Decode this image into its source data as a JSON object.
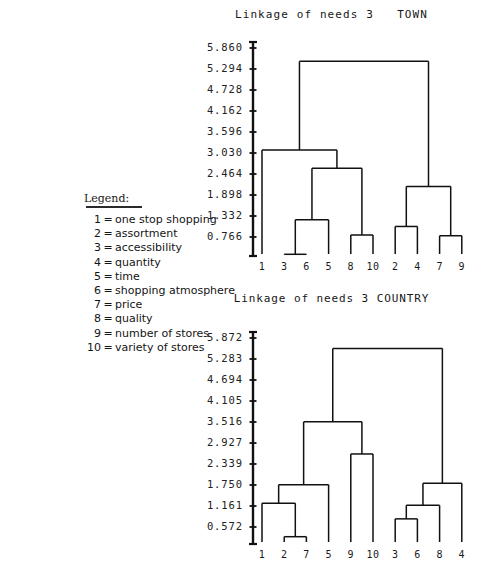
{
  "page": {
    "background": "#ffffff",
    "ink": "#1a1a1a"
  },
  "legend": {
    "title": "Legend:",
    "items": [
      {
        "num": "1",
        "eq": "=",
        "label": "one stop shopping"
      },
      {
        "num": "2",
        "eq": "=",
        "label": "assortment"
      },
      {
        "num": "3",
        "eq": "=",
        "label": "accessibility"
      },
      {
        "num": "4",
        "eq": "=",
        "label": "quantity"
      },
      {
        "num": "5",
        "eq": "=",
        "label": "time"
      },
      {
        "num": "6",
        "eq": "=",
        "label": "shopping atmosphere"
      },
      {
        "num": "7",
        "eq": "=",
        "label": "price"
      },
      {
        "num": "8",
        "eq": "=",
        "label": "quality"
      },
      {
        "num": "9",
        "eq": "=",
        "label": "number of stores"
      },
      {
        "num": "10",
        "eq": "=",
        "label": "variety of stores"
      }
    ]
  },
  "chart_data": [
    {
      "id": "town",
      "type": "dendrogram",
      "title": "Linkage of needs 3   TOWN",
      "xlabel": "",
      "ylabel": "",
      "grid": false,
      "legend_position": "none",
      "ylim": [
        0.2,
        5.86
      ],
      "axis_ticks": [
        "5.860",
        "5.294",
        "4.728",
        "4.162",
        "3.596",
        "3.030",
        "2.464",
        "1.898",
        "1.332",
        "0.766"
      ],
      "tick_values": [
        5.86,
        5.294,
        4.728,
        4.162,
        3.596,
        3.03,
        2.464,
        1.898,
        1.332,
        0.766
      ],
      "leaf_order": [
        "1",
        "3",
        "6",
        "5",
        "8",
        "10",
        "2",
        "4",
        "7",
        "9"
      ],
      "merges": [
        {
          "name": "3+6",
          "members": [
            "3",
            "6"
          ],
          "height": 0.3
        },
        {
          "name": "7+9",
          "members": [
            "7",
            "9"
          ],
          "height": 0.8
        },
        {
          "name": "8+10",
          "members": [
            "8",
            "10"
          ],
          "height": 0.82
        },
        {
          "name": "2+4",
          "members": [
            "2",
            "4"
          ],
          "height": 1.05
        },
        {
          "name": "(3+6)+5",
          "members": [
            "3",
            "6",
            "5"
          ],
          "height": 1.23
        },
        {
          "name": "(2+4)+(7+9)",
          "members": [
            "2",
            "4",
            "7",
            "9"
          ],
          "height": 2.13
        },
        {
          "name": "((3+6)+5)+(8+10)",
          "members": [
            "3",
            "6",
            "5",
            "8",
            "10"
          ],
          "height": 2.62
        },
        {
          "name": "1+left",
          "members": [
            "1",
            "3",
            "6",
            "5",
            "8",
            "10"
          ],
          "height": 3.11
        },
        {
          "name": "root",
          "members": [
            "1",
            "3",
            "6",
            "5",
            "8",
            "10",
            "2",
            "4",
            "7",
            "9"
          ],
          "height": 5.5
        }
      ]
    },
    {
      "id": "country",
      "type": "dendrogram",
      "title": "Linkage of needs 3 COUNTRY",
      "xlabel": "",
      "ylabel": "",
      "grid": false,
      "legend_position": "none",
      "ylim": [
        0.1,
        5.872
      ],
      "axis_ticks": [
        "5.872",
        "5.283",
        "4.694",
        "4.105",
        "3.516",
        "2.927",
        "2.339",
        "1.750",
        "1.161",
        "0.572"
      ],
      "tick_values": [
        5.872,
        5.283,
        4.694,
        4.105,
        3.516,
        2.927,
        2.339,
        1.75,
        1.161,
        0.572
      ],
      "leaf_order": [
        "1",
        "2",
        "7",
        "5",
        "9",
        "10",
        "3",
        "6",
        "8",
        "4"
      ],
      "merges": [
        {
          "name": "2+7",
          "members": [
            "2",
            "7"
          ],
          "height": 0.3
        },
        {
          "name": "3+6",
          "members": [
            "3",
            "6"
          ],
          "height": 0.8
        },
        {
          "name": "(3+6)+8",
          "members": [
            "3",
            "6",
            "8"
          ],
          "height": 1.18
        },
        {
          "name": "1+(2+7)",
          "members": [
            "1",
            "2",
            "7"
          ],
          "height": 1.24
        },
        {
          "name": "left+5",
          "members": [
            "1",
            "2",
            "7",
            "5"
          ],
          "height": 1.76
        },
        {
          "name": "right+4",
          "members": [
            "3",
            "6",
            "8",
            "4"
          ],
          "height": 1.8
        },
        {
          "name": "9+10",
          "members": [
            "9",
            "10"
          ],
          "height": 2.62
        },
        {
          "name": "mid",
          "members": [
            "1",
            "2",
            "7",
            "5",
            "9",
            "10"
          ],
          "height": 3.52
        },
        {
          "name": "root",
          "members": [
            "1",
            "2",
            "7",
            "5",
            "9",
            "10",
            "3",
            "6",
            "8",
            "4"
          ],
          "height": 5.58
        }
      ]
    }
  ]
}
